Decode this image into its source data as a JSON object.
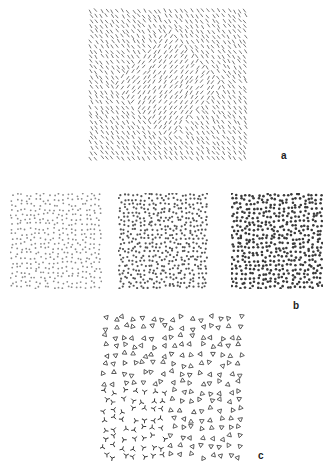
{
  "figure": {
    "labels": {
      "a": "a",
      "b": "b",
      "c": "c"
    },
    "colors": {
      "background": "#ffffff",
      "mark": "#555555",
      "mark_light": "#8a8a8a",
      "mark_dark": "#3a3a3a"
    },
    "panel_a": {
      "description": "Texture of short oriented line segments; a central diamond region with different orientation",
      "element": "line-segment",
      "grid": {
        "cols": 30,
        "rows": 30
      },
      "background_angle_deg": 55,
      "figure_angle_deg": -55
    },
    "panel_b": [
      {
        "id": "b-left",
        "element": "dot",
        "density": "sparse-light",
        "dot_radius": 0.9
      },
      {
        "id": "b-middle",
        "element": "dot",
        "density": "medium",
        "dot_radius": 1.1
      },
      {
        "id": "b-right",
        "element": "dot",
        "density": "dense-dark",
        "dot_radius": 1.3
      }
    ],
    "panel_c": {
      "description": "Texture of small triangles with a lower-left region of arrow/Y-shaped elements",
      "elements": [
        "triangle",
        "arrow-junction"
      ]
    }
  }
}
